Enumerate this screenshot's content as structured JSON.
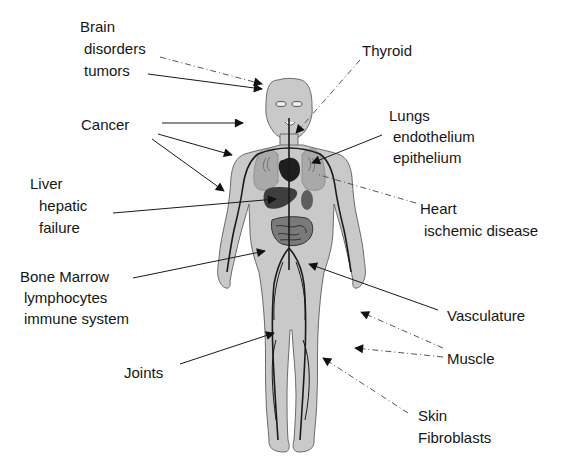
{
  "diagram": {
    "type": "anatomical-annotation",
    "colors": {
      "background": "#ffffff",
      "body_fill": "#c9c9c9",
      "body_outline": "#6a6a6a",
      "organ_dark": "#3a3a3a",
      "organ_mid": "#6e6e6e",
      "lung_fill": "#a9a9a9",
      "vessel": "#1a1a1a",
      "text": "#161616",
      "arrow": "#1a1a1a",
      "dashed_arrow": "#555555"
    }
  },
  "labels": {
    "brain": {
      "lines": [
        "Brain",
        "disorders",
        "tumors"
      ]
    },
    "thyroid": {
      "lines": [
        "Thyroid"
      ]
    },
    "cancer": {
      "lines": [
        "Cancer"
      ]
    },
    "lungs": {
      "lines": [
        "Lungs",
        "endothelium",
        "epithelium"
      ]
    },
    "liver": {
      "lines": [
        "Liver",
        "hepatic",
        "failure"
      ]
    },
    "heart": {
      "lines": [
        "Heart",
        "ischemic disease"
      ]
    },
    "bone_marrow": {
      "lines": [
        "Bone Marrow",
        "lymphocytes",
        "immune system"
      ]
    },
    "vasculature": {
      "lines": [
        "Vasculature"
      ]
    },
    "muscle": {
      "lines": [
        "Muscle"
      ]
    },
    "joints": {
      "lines": [
        "Joints"
      ]
    },
    "skin": {
      "lines": [
        "Skin",
        "Fibroblasts"
      ]
    }
  },
  "arrows": [
    {
      "from": "brain-disorders",
      "style": "dash-dot",
      "to": "head"
    },
    {
      "from": "brain-tumors",
      "style": "solid",
      "to": "head"
    },
    {
      "from": "thyroid",
      "style": "dash-dot",
      "to": "neck"
    },
    {
      "from": "cancer",
      "style": "solid",
      "to": "shoulder"
    },
    {
      "from": "cancer",
      "style": "solid",
      "to": "upper-arm"
    },
    {
      "from": "cancer",
      "style": "solid",
      "to": "forearm"
    },
    {
      "from": "lungs",
      "style": "solid",
      "to": "left-lung"
    },
    {
      "from": "liver",
      "style": "solid",
      "to": "liver"
    },
    {
      "from": "heart",
      "style": "dash-dot",
      "to": "heart"
    },
    {
      "from": "bone-marrow",
      "style": "solid",
      "to": "pelvis"
    },
    {
      "from": "vasculature",
      "style": "solid",
      "to": "femoral-vessel"
    },
    {
      "from": "muscle",
      "style": "dash-dot",
      "to": "beside-thigh"
    },
    {
      "from": "muscle",
      "style": "dash-dot",
      "to": "beside-knee"
    },
    {
      "from": "joints",
      "style": "solid",
      "to": "knee"
    },
    {
      "from": "skin",
      "style": "dash-dot",
      "to": "calf"
    }
  ]
}
